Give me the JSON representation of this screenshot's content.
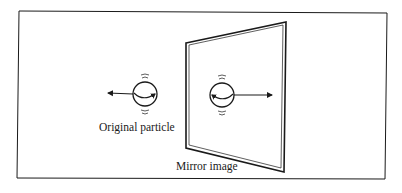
{
  "figure": {
    "labels": {
      "original": "Original particle",
      "mirror": "Mirror image"
    },
    "colors": {
      "ink": "#1a1a1a",
      "background": "#ffffff"
    },
    "elements": {
      "frame": "outer-border-box",
      "mirror": "parallelogram-mirror-plane",
      "original_particle": {
        "spin": "clockwise-arrow (right-pointing arc)",
        "momentum": "arrow-left"
      },
      "mirror_particle": {
        "spin": "counter-clockwise-arrow (left-pointing arc)",
        "momentum": "arrow-right"
      }
    }
  }
}
